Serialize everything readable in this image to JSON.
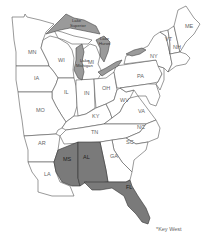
{
  "map": {
    "region": "Eastern United States",
    "highlight_color": "#7a7a7a",
    "lake_color": "#9a9a9a",
    "states": [
      {
        "abbr": "MN",
        "shaded": false
      },
      {
        "abbr": "WI",
        "shaded": false
      },
      {
        "abbr": "MI",
        "shaded": false
      },
      {
        "abbr": "IA",
        "shaded": false
      },
      {
        "abbr": "IL",
        "shaded": false
      },
      {
        "abbr": "IN",
        "shaded": false
      },
      {
        "abbr": "OH",
        "shaded": false
      },
      {
        "abbr": "MO",
        "shaded": false
      },
      {
        "abbr": "KY",
        "shaded": false
      },
      {
        "abbr": "WV",
        "shaded": false
      },
      {
        "abbr": "VA",
        "shaded": false
      },
      {
        "abbr": "PA",
        "shaded": false
      },
      {
        "abbr": "NY",
        "shaded": false
      },
      {
        "abbr": "VT",
        "shaded": false
      },
      {
        "abbr": "NH",
        "shaded": false
      },
      {
        "abbr": "ME",
        "shaded": false
      },
      {
        "abbr": "AR",
        "shaded": false
      },
      {
        "abbr": "TN",
        "shaded": false
      },
      {
        "abbr": "NC",
        "shaded": false
      },
      {
        "abbr": "SC",
        "shaded": false
      },
      {
        "abbr": "GA",
        "shaded": false
      },
      {
        "abbr": "LA",
        "shaded": false
      },
      {
        "abbr": "MS",
        "shaded": true
      },
      {
        "abbr": "AL",
        "shaded": true
      },
      {
        "abbr": "FL",
        "shaded": true
      }
    ],
    "lakes": {
      "superior": "Lake Superior",
      "michigan": "Lake Michigan",
      "huron": "Lake Huron"
    },
    "labels": {
      "MN": "MN",
      "WI": "WI",
      "MI": "MI",
      "IA": "IA",
      "IL": "IL",
      "IN": "IN",
      "OH": "OH",
      "MO": "MO",
      "KY": "KY",
      "WV": "WV",
      "VA": "VA",
      "PA": "PA",
      "NY": "NY",
      "VT": "VT",
      "NH": "NH",
      "ME": "ME",
      "AR": "AR",
      "TN": "TN",
      "NC": "NC",
      "SC": "SC",
      "GA": "GA",
      "LA": "LA",
      "MS": "MS",
      "AL": "AL",
      "FL": "FL"
    },
    "footnote": "*Key West"
  }
}
